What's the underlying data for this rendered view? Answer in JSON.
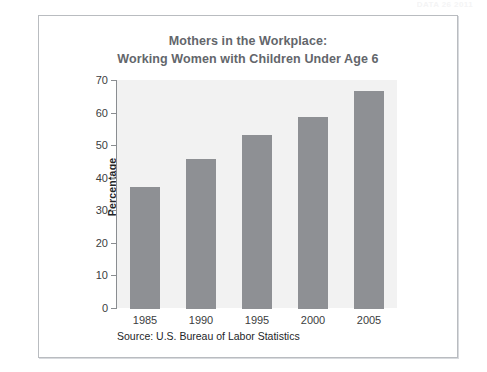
{
  "figure": {
    "top_faint_text": "DATA 26 2011",
    "source_note": "Source: U.S. Bureau of Labor Statistics",
    "frame_color": "#b9bcc0",
    "plot_background": "#f2f2f2",
    "bar_color": "#8e9094",
    "title_color": "#63666b"
  },
  "chart_data": {
    "type": "bar",
    "title": "Mothers in the Workplace: Working Women with Children Under Age 6",
    "title_lines": [
      "Mothers in the Workplace:",
      "Working Women with Children Under Age 6"
    ],
    "xlabel": "",
    "ylabel": "Percentage",
    "categories": [
      "1985",
      "1990",
      "1995",
      "2000",
      "2005"
    ],
    "values": [
      37.5,
      46,
      53.5,
      59,
      67
    ],
    "series": [
      {
        "name": "Working Women with Children Under Age 6",
        "values": [
          37.5,
          46,
          53.5,
          59,
          67
        ]
      }
    ],
    "ylim": [
      0,
      70
    ],
    "ytick_values": [
      0,
      10,
      20,
      30,
      40,
      50,
      60,
      70
    ],
    "ytick_labels": [
      "0",
      "10",
      "20",
      "30",
      "40",
      "50",
      "60",
      "70"
    ],
    "grid": false,
    "legend": false,
    "legend_position": "none",
    "annotations": [
      "Source: U.S. Bureau of Labor Statistics"
    ]
  }
}
